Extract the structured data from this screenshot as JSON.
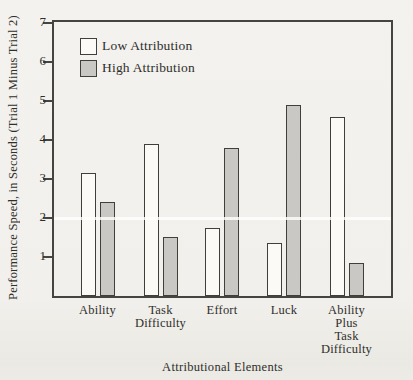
{
  "figure": {
    "kind": "scanned-book-bar-chart"
  },
  "chart_data": {
    "type": "bar",
    "title": "",
    "xlabel": "Attributional Elements",
    "ylabel": "Performance Speed, in Seconds (Trial 1 Minus Trial 2)",
    "ylim": [
      0,
      7
    ],
    "yticks": [
      1,
      2,
      3,
      4,
      5,
      6,
      7
    ],
    "grid": false,
    "legend_position": "top-left",
    "categories": [
      "Ability",
      "Task Difficulty",
      "Effort",
      "Luck",
      "Ability Plus Task Difficulty"
    ],
    "category_label_lines": [
      [
        "Ability"
      ],
      [
        "Task",
        "Difficulty"
      ],
      [
        "Effort"
      ],
      [
        "Luck"
      ],
      [
        "Ability",
        "Plus",
        "Task",
        "Difficulty"
      ]
    ],
    "series": [
      {
        "name": "Low Attribution",
        "values": [
          3.15,
          3.9,
          1.75,
          1.35,
          4.6
        ],
        "fill": "#fbfaf6"
      },
      {
        "name": "High Attribution",
        "values": [
          2.4,
          1.5,
          3.8,
          4.9,
          0.85
        ],
        "fill": "#c9c8c4"
      }
    ],
    "scan_artifact_white_line_at_value": 2
  },
  "colors": {
    "background": "#f1f0ec",
    "axis_line": "#45443f",
    "bar_outline": "#403f3a",
    "low_attribution_fill": "#fbfaf6",
    "high_attribution_fill": "#c9c8c4",
    "text": "#2f2e2b"
  }
}
